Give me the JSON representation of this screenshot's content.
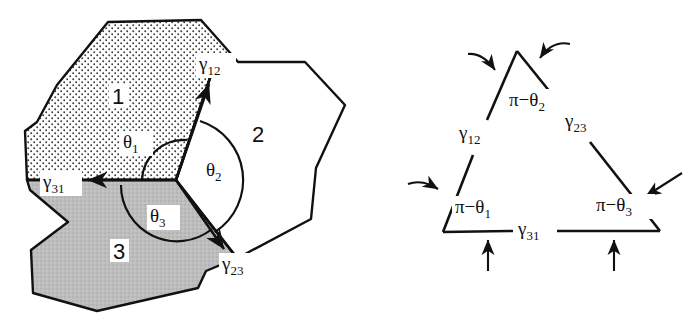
{
  "figure": {
    "panels": [
      {
        "name": "left-panel",
        "description": "Three grains meeting at a triple junction with surface tension vectors and dihedral angles",
        "regions": [
          {
            "id": "region-1",
            "label": "1",
            "fill": "stipple",
            "fill_color": "#ffffff",
            "label_x": 118,
            "label_y": 97
          },
          {
            "id": "region-2",
            "label": "2",
            "fill": "white",
            "fill_color": "#ffffff",
            "label_x": 258,
            "label_y": 135
          },
          {
            "id": "region-3",
            "label": "3",
            "fill": "gray",
            "fill_color": "#b9b9b9",
            "label_x": 119,
            "label_y": 252
          }
        ],
        "vectors": [
          {
            "id": "gamma-12",
            "label": "γ",
            "sub": "12",
            "label_x": 209,
            "label_y": 66
          },
          {
            "id": "gamma-23",
            "label": "γ",
            "sub": "23",
            "label_x": 232,
            "label_y": 266
          },
          {
            "id": "gamma-31",
            "label": "γ",
            "sub": "31",
            "label_x": 53,
            "label_y": 184
          }
        ],
        "angles": [
          {
            "id": "theta-1",
            "label": "θ",
            "sub": "1",
            "label_x": 133,
            "label_y": 144
          },
          {
            "id": "theta-2",
            "label": "θ",
            "sub": "2",
            "label_x": 216,
            "label_y": 172
          },
          {
            "id": "theta-3",
            "label": "θ",
            "sub": "3",
            "label_x": 160,
            "label_y": 218
          }
        ]
      },
      {
        "name": "right-panel",
        "description": "Closed vector triangle of the three surface tensions with exterior angles",
        "edge_labels": [
          {
            "id": "tri-gamma-12",
            "label": "γ",
            "sub": "12",
            "label_x": 468,
            "label_y": 135
          },
          {
            "id": "tri-gamma-23",
            "label": "γ",
            "sub": "23",
            "label_x": 574,
            "label_y": 123
          },
          {
            "id": "tri-gamma-31",
            "label": "γ",
            "sub": "31",
            "label_x": 529,
            "label_y": 231
          }
        ],
        "angle_labels": [
          {
            "id": "tri-angle-1",
            "label": "π−θ",
            "sub": "1",
            "label_x": 470,
            "label_y": 209
          },
          {
            "id": "tri-angle-2",
            "label": "π−θ",
            "sub": "2",
            "label_x": 527,
            "label_y": 102
          },
          {
            "id": "tri-angle-3",
            "label": "π−θ",
            "sub": "3",
            "label_x": 614,
            "label_y": 207
          }
        ]
      }
    ],
    "colors": {
      "stroke": "#111111",
      "region1_fill": "#ffffff",
      "region2_fill": "#ffffff",
      "region3_fill": "#b9b9b9",
      "background": "#ffffff"
    }
  }
}
